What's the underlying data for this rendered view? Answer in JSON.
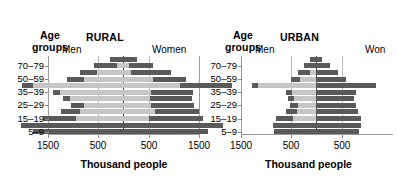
{
  "figure": {
    "panels": [
      {
        "id": "rural",
        "title": "RURAL",
        "age_axis_label_line1": "Age",
        "age_axis_label_line2": "groups",
        "left_label": "Men",
        "right_label": "Women",
        "xlabel": "Thousand people",
        "xticks": [
          "1500",
          "500",
          "500",
          "1500"
        ],
        "yticks": [
          "70–79",
          "50–59",
          "35–39",
          "25–29",
          "15–19",
          "5–9"
        ]
      },
      {
        "id": "urban",
        "title": "URBAN",
        "age_axis_label_line1": "Age",
        "age_axis_label_line2": "groups",
        "left_label": "Men",
        "right_label": "Won",
        "xlabel": "Thousand people",
        "xticks": [
          "1500",
          "500",
          "500"
        ],
        "yticks": [
          "70–79",
          "50–59",
          "35–39",
          "25–29",
          "15–19",
          "5–9"
        ]
      }
    ],
    "colors": {
      "bar_light": "#c6c6c6",
      "bar_dark": "#5a5a5a",
      "axis": "#9a9a9a",
      "gridline": "#b9b9b9",
      "centerline": "#4a4a4a",
      "background": "#ffffff",
      "text": "#000000"
    }
  },
  "chart_data": [
    {
      "type": "bar",
      "subtype": "population-pyramid",
      "title": "RURAL",
      "xlabel": "Thousand people",
      "ylabel": "Age groups",
      "xlim": [
        -1500,
        1500
      ],
      "xticks": [
        -1500,
        -500,
        500,
        1500
      ],
      "xtick_labels": [
        "1500",
        "500",
        "500",
        "1500"
      ],
      "gridlines": [
        -500,
        0,
        500
      ],
      "grid": true,
      "legend": {
        "left": "Men",
        "right": "Women",
        "position": "top"
      },
      "categories": [
        "5–9",
        "10–14",
        "15–19",
        "20–24",
        "25–29",
        "30–34",
        "35–39",
        "40–49",
        "50–59",
        "60–69",
        "70–79",
        "80+"
      ],
      "ytick_labels": [
        "5–9",
        "15–19",
        "25–29",
        "35–39",
        "50–59",
        "70–79"
      ],
      "series": [
        {
          "name": "Men",
          "values": [
            900,
            1020,
            800,
            620,
            520,
            600,
            700,
            1010,
            560,
            430,
            290,
            130
          ]
        },
        {
          "name": "Women",
          "values": [
            850,
            1000,
            800,
            760,
            710,
            690,
            700,
            1090,
            630,
            480,
            300,
            140
          ]
        }
      ],
      "segment_note": "each bar has a dark outer segment and a light inner segment"
    },
    {
      "type": "bar",
      "subtype": "population-pyramid",
      "title": "URBAN",
      "xlabel": "Thousand people",
      "ylabel": "Age groups",
      "xlim": [
        -1500,
        1500
      ],
      "xticks": [
        -1500,
        -500,
        500
      ],
      "xtick_labels": [
        "1500",
        "500",
        "500"
      ],
      "gridlines": [
        -500,
        0,
        500
      ],
      "grid": true,
      "legend": {
        "left": "Men",
        "right": "Won",
        "position": "top"
      },
      "categories": [
        "5–9",
        "10–14",
        "15–19",
        "20–24",
        "25–29",
        "30–34",
        "35–39",
        "40–49",
        "50–59",
        "60–69",
        "70–79",
        "80+"
      ],
      "ytick_labels": [
        "5–9",
        "15–19",
        "25–29",
        "35–39",
        "50–59",
        "70–79"
      ],
      "series": [
        {
          "name": "Men",
          "values": [
            420,
            430,
            400,
            300,
            260,
            280,
            300,
            640,
            250,
            180,
            120,
            60
          ]
        },
        {
          "name": "Women",
          "values": [
            430,
            450,
            450,
            420,
            400,
            380,
            400,
            600,
            300,
            220,
            140,
            60
          ]
        }
      ],
      "segment_note": "each bar has a dark outer segment and a light inner segment"
    }
  ],
  "bars": {
    "rural": [
      {
        "age": "80+",
        "men_total": 130,
        "men_dark": 130,
        "women_total": 140,
        "women_dark": 140
      },
      {
        "age": "70–79",
        "men_total": 290,
        "men_dark": 230,
        "women_total": 300,
        "women_dark": 240
      },
      {
        "age": "60–69",
        "men_total": 430,
        "men_dark": 170,
        "women_total": 480,
        "women_dark": 400
      },
      {
        "age": "50–59",
        "men_total": 560,
        "men_dark": 170,
        "women_total": 630,
        "women_dark": 330
      },
      {
        "age": "40–49",
        "men_total": 1010,
        "men_dark": 110,
        "women_total": 1090,
        "women_dark": 520
      },
      {
        "age": "35–39",
        "men_total": 700,
        "men_dark": 70,
        "women_total": 700,
        "women_dark": 420
      },
      {
        "age": "30–34",
        "men_total": 600,
        "men_dark": 70,
        "women_total": 690,
        "women_dark": 420
      },
      {
        "age": "25–29",
        "men_total": 520,
        "men_dark": 130,
        "women_total": 710,
        "women_dark": 430
      },
      {
        "age": "20–24",
        "men_total": 620,
        "men_dark": 190,
        "women_total": 760,
        "women_dark": 440
      },
      {
        "age": "15–19",
        "men_total": 800,
        "men_dark": 330,
        "women_total": 800,
        "women_dark": 540
      },
      {
        "age": "10–14",
        "men_total": 1020,
        "men_dark": 1020,
        "women_total": 1000,
        "women_dark": 1000
      },
      {
        "age": "5–9",
        "men_total": 900,
        "men_dark": 900,
        "women_total": 850,
        "women_dark": 850
      }
    ],
    "urban": [
      {
        "age": "80+",
        "men_total": 60,
        "men_dark": 60,
        "women_total": 60,
        "women_dark": 60
      },
      {
        "age": "70–79",
        "men_total": 120,
        "men_dark": 120,
        "women_total": 140,
        "women_dark": 140
      },
      {
        "age": "60–69",
        "men_total": 180,
        "men_dark": 120,
        "women_total": 220,
        "women_dark": 220
      },
      {
        "age": "50–59",
        "men_total": 250,
        "men_dark": 90,
        "women_total": 300,
        "women_dark": 300
      },
      {
        "age": "40–49",
        "men_total": 640,
        "men_dark": 60,
        "women_total": 600,
        "women_dark": 600
      },
      {
        "age": "35–39",
        "men_total": 300,
        "men_dark": 60,
        "women_total": 400,
        "women_dark": 400
      },
      {
        "age": "30–34",
        "men_total": 280,
        "men_dark": 60,
        "women_total": 380,
        "women_dark": 380
      },
      {
        "age": "25–29",
        "men_total": 260,
        "men_dark": 80,
        "women_total": 400,
        "women_dark": 400
      },
      {
        "age": "20–24",
        "men_total": 300,
        "men_dark": 110,
        "women_total": 420,
        "women_dark": 420
      },
      {
        "age": "15–19",
        "men_total": 400,
        "men_dark": 170,
        "women_total": 450,
        "women_dark": 450
      },
      {
        "age": "10–14",
        "men_total": 430,
        "men_dark": 430,
        "women_total": 450,
        "women_dark": 450
      },
      {
        "age": "5–9",
        "men_total": 420,
        "men_dark": 420,
        "women_total": 430,
        "women_dark": 430
      }
    ]
  }
}
